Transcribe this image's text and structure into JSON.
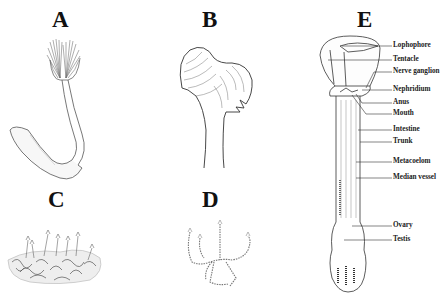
{
  "figure": {
    "panels": [
      {
        "id": "A",
        "letter": "A",
        "subject": "single-zooid-j-shaped"
      },
      {
        "id": "B",
        "letter": "B",
        "subject": "lophophore-close-up"
      },
      {
        "id": "C",
        "letter": "C",
        "subject": "colony-clump"
      },
      {
        "id": "D",
        "letter": "D",
        "subject": "branching-colony"
      },
      {
        "id": "E",
        "letter": "E",
        "subject": "internal-anatomy"
      }
    ],
    "anatomy_labels": [
      "Lophophore",
      "Tentacle",
      "Nerve ganglion",
      "Nephridium",
      "Anus",
      "Mouth",
      "Intestine",
      "Trunk",
      "Metacoelom",
      "Median vessel",
      "Ovary",
      "Testis"
    ]
  }
}
